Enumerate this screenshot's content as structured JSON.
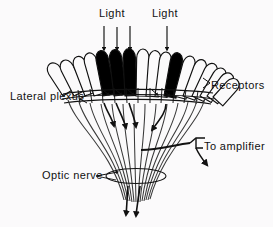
{
  "figure": {
    "background_color": "#fbfafb",
    "ink_color": "#111111"
  },
  "labels": {
    "light_left": "Light",
    "light_right": "Light",
    "receptors": "Receptors",
    "lateral_plexus": "Lateral plexus",
    "to_amplifier": "To amplifier",
    "optic_nerve": "Optic nerve"
  },
  "diagram": {
    "receptor_count": 17,
    "illuminated_receptor_indices": [
      5,
      6,
      7,
      11
    ],
    "illuminated_receptor_fill": "#000000",
    "unilluminated_receptor_fill": "#fbfafb",
    "light_arrow_count_left": 3,
    "light_arrow_count_right": 1,
    "light_arrow_x_positions": [
      104,
      117,
      130,
      167
    ],
    "light_arrow_top": 26,
    "light_arrow_bottom": 50,
    "plexus_rows": 3,
    "optic_nerve_axon_count": 17,
    "nerve_terminal_arrowheads": 2,
    "amplifier_electrode": "hook-bracket",
    "fan_center_x": 136,
    "fan_apex_y": 200
  },
  "icons": {
    "light_arrow": "down-arrow-icon",
    "leader_line": "leader-line-icon",
    "electrode": "electrode-hook-icon",
    "nerve_arrowhead": "arrowhead-icon"
  }
}
